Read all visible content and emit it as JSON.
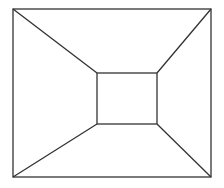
{
  "diagram": {
    "type": "truncated-pyramid-top-view",
    "stroke_color": "#333333",
    "background": "#ffffff",
    "outer_rect": {
      "x1": 13,
      "y1": 9,
      "x2": 211,
      "y2": 177
    },
    "inner_rect": {
      "x1": 97,
      "y1": 73,
      "x2": 157,
      "y2": 124
    }
  }
}
